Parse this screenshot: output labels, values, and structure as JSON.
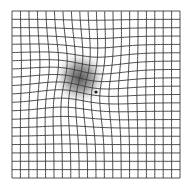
{
  "diagram": {
    "grid": {
      "cells": 20,
      "left": 12,
      "top": 11,
      "right": 180,
      "bottom": 178,
      "line_color": "#3a3a3a",
      "line_width": 0.9
    },
    "distortion": {
      "center_x": 80,
      "center_y": 80,
      "radius": 48,
      "strength": 9
    },
    "blur_spot": {
      "center_x": 80,
      "center_y": 78,
      "radius": 28,
      "color": "#4a4a4a"
    },
    "fixation_dot": {
      "x": 96,
      "y": 92,
      "r": 1.6,
      "color": "#222222"
    },
    "background": "#ffffff"
  }
}
